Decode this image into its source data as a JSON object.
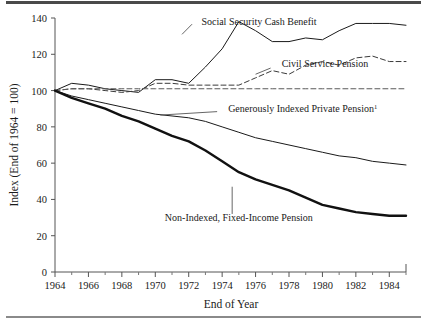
{
  "chart_data": {
    "type": "line",
    "title": "",
    "xlabel": "End of Year",
    "ylabel": "Index (End of 1964 = 100)",
    "xlim": [
      1964,
      1985
    ],
    "ylim": [
      0,
      140
    ],
    "xticks": [
      1964,
      1966,
      1968,
      1970,
      1972,
      1974,
      1976,
      1978,
      1980,
      1982,
      1984
    ],
    "xticklabels": [
      "1964",
      "1966",
      "1968",
      "1970",
      "1972",
      "1974",
      "1976",
      "1978",
      "1980",
      "1982",
      "1984"
    ],
    "yticks": [
      0,
      20,
      40,
      60,
      80,
      100,
      120,
      140
    ],
    "yticklabels": [
      "0",
      "20",
      "40",
      "60",
      "80",
      "100",
      "120",
      "140"
    ],
    "minor_xticks": [
      1965,
      1967,
      1969,
      1971,
      1973,
      1975,
      1977,
      1979,
      1981,
      1983,
      1985
    ],
    "grid": false,
    "legend": "inline-annotations",
    "x": [
      1964,
      1965,
      1966,
      1967,
      1968,
      1969,
      1970,
      1971,
      1972,
      1973,
      1974,
      1975,
      1976,
      1977,
      1978,
      1979,
      1980,
      1981,
      1982,
      1983,
      1984,
      1985
    ],
    "series": [
      {
        "name": "Social Security Cash Benefit",
        "style": "solid-thin",
        "color": "#1a1a1a",
        "label": "Social Security Cash Benefit",
        "values": [
          100,
          104,
          103,
          101,
          100,
          99,
          106,
          106,
          104,
          113,
          123,
          138,
          133,
          127,
          127,
          129,
          128,
          133,
          137,
          137,
          137,
          136
        ]
      },
      {
        "name": "Civil Service Pension",
        "style": "dashed",
        "color": "#3a3a3a",
        "label": "Civil Service Pension",
        "values": [
          100,
          101,
          101,
          100,
          99,
          100,
          104,
          104,
          103,
          103,
          103,
          103,
          107,
          111,
          109,
          114,
          116,
          114,
          118,
          119,
          116,
          116
        ]
      },
      {
        "name": "Indexed Floor Pension",
        "style": "dashed-flat",
        "color": "#5a5a5a",
        "label": "",
        "values": [
          100,
          101,
          101,
          101,
          101,
          101,
          101,
          101,
          101,
          101,
          101,
          101,
          101,
          101,
          101,
          101,
          101,
          101,
          101,
          101,
          101,
          101
        ]
      },
      {
        "name": "Generously Indexed Private Pension",
        "style": "solid-thin",
        "color": "#1a1a1a",
        "label": "Generously Indexed Private Pension",
        "label_superscript": "1",
        "values": [
          100,
          97,
          95,
          93,
          91,
          89,
          87,
          86,
          85,
          83,
          80,
          77,
          74,
          72,
          70,
          68,
          66,
          64,
          63,
          61,
          60,
          59
        ]
      },
      {
        "name": "Non-Indexed, Fixed-Income Pension",
        "style": "solid-thick",
        "color": "#111111",
        "label": "Non-Indexed, Fixed-Income Pension",
        "values": [
          100,
          96,
          93,
          90,
          86,
          83,
          79,
          75,
          72,
          67,
          61,
          55,
          51,
          48,
          45,
          41,
          37,
          35,
          33,
          32,
          31,
          31
        ]
      }
    ],
    "annotations": [
      {
        "text": "Social Security Cash Benefit",
        "x": 1972.4,
        "y": 136
      },
      {
        "text": "Civil Service Pension",
        "x": 1977.2,
        "y": 113
      },
      {
        "text": "Generously Indexed Private Pension",
        "x": 1974.0,
        "y": 88,
        "superscript": "1"
      },
      {
        "text": "Non-Indexed, Fixed-Income Pension",
        "x": 1975.0,
        "y": 28
      }
    ]
  }
}
